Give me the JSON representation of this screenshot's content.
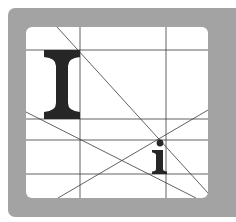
{
  "figure": {
    "frame_color": "#a3a3a3",
    "panel_color": "#ffffff",
    "line_color": "#3a3a3a",
    "glyph_color": "#262626",
    "large_letter": "I",
    "small_letter": "i",
    "vertical_lines_x": [
      80,
      166
    ],
    "horizontal_lines_y": [
      50,
      119,
      140,
      174
    ]
  }
}
